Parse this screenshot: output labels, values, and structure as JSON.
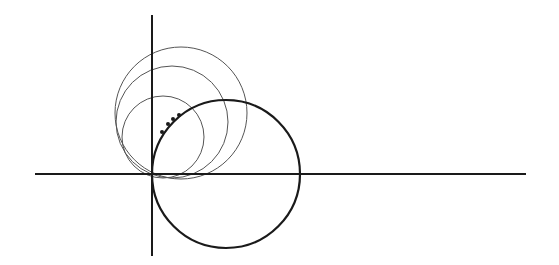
{
  "diagram": {
    "type": "geometric-construction",
    "colors": {
      "background": "#ffffff",
      "stroke": "#1a1a1a",
      "thin_stroke": "#555555"
    },
    "axes": {
      "x_axis": {
        "x1": 35,
        "y1": 174,
        "x2": 526,
        "y2": 174,
        "width": 2
      },
      "y_axis": {
        "x1": 152,
        "y1": 15,
        "x2": 152,
        "y2": 256,
        "width": 2
      }
    },
    "bold_circle": {
      "cx": 226,
      "cy": 174,
      "r": 74,
      "width": 2.2
    },
    "thin_circles": [
      {
        "cx": 163,
        "cy": 137,
        "r": 41
      },
      {
        "cx": 172,
        "cy": 122,
        "r": 56
      },
      {
        "cx": 181,
        "cy": 113,
        "r": 66
      }
    ],
    "dots": [
      {
        "cx": 162,
        "cy": 132,
        "r": 2
      },
      {
        "cx": 168,
        "cy": 124,
        "r": 2
      },
      {
        "cx": 173,
        "cy": 119,
        "r": 2
      },
      {
        "cx": 179,
        "cy": 115,
        "r": 2
      }
    ]
  }
}
